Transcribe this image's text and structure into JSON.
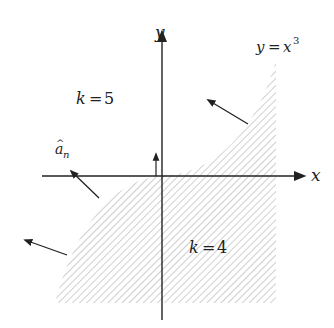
{
  "diagram": {
    "axes": {
      "x_label": "x",
      "y_label": "y"
    },
    "curve": {
      "label_lhs": "y",
      "label_eq": "=",
      "label_base": "x",
      "label_exp": "3"
    },
    "regions": [
      {
        "name": "k5",
        "var": "k",
        "eq": "=",
        "value": "5",
        "shaded": false
      },
      {
        "name": "k4",
        "var": "k",
        "eq": "=",
        "value": "4",
        "shaded": true
      }
    ],
    "normal_vector": {
      "label_base": "a",
      "label_hat": "^",
      "label_sub": "n"
    },
    "colors": {
      "ink": "#222222",
      "hatch": "#b8b8b8",
      "background": "#ffffff"
    }
  }
}
